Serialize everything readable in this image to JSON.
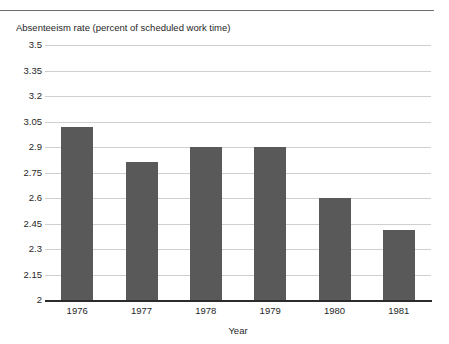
{
  "caption": "Absenteeism rate (percent of scheduled work time)",
  "colors": {
    "bar": "#595959",
    "gridline": "#cfcfcf",
    "axis": "#2b2b2b",
    "rule": "#6e6e6e",
    "text": "#1f1f1f",
    "background": "#ffffff"
  },
  "chart_data": {
    "type": "bar",
    "title": "Absenteeism rate (percent of scheduled work time)",
    "xlabel": "Year",
    "ylabel": "",
    "categories": [
      "1976",
      "1977",
      "1978",
      "1979",
      "1980",
      "1981"
    ],
    "values": [
      3.02,
      2.81,
      2.9,
      2.9,
      2.6,
      2.41
    ],
    "ylim": [
      2,
      3.5
    ],
    "ytick_labels": [
      "2",
      "2.15",
      "2.3",
      "2.45",
      "2.6",
      "2.75",
      "2.9",
      "3.05",
      "3.2",
      "3.35",
      "3.5"
    ],
    "ytick_values": [
      2,
      2.15,
      2.3,
      2.45,
      2.6,
      2.75,
      2.9,
      3.05,
      3.2,
      3.35,
      3.5
    ],
    "grid": true,
    "legend": null
  }
}
